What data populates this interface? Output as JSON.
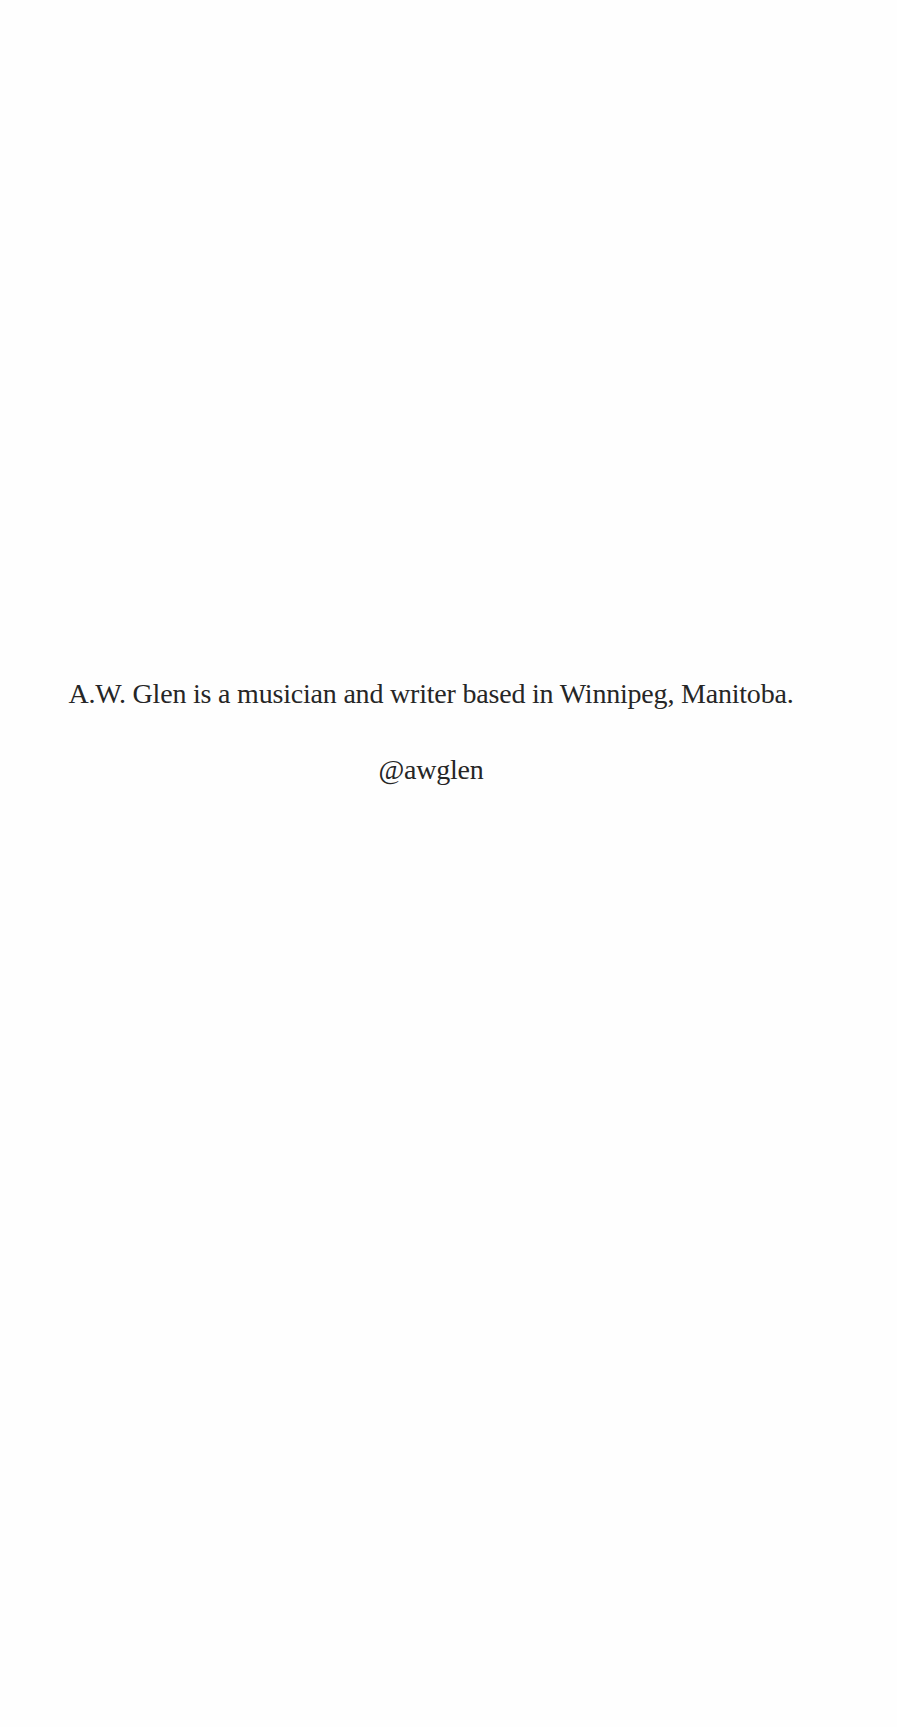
{
  "page": {
    "bio_text": "A.W. Glen is a musician and writer based in Winnipeg, Manitoba.",
    "social_handle": "@awglen",
    "colors": {
      "background": "#fefefe",
      "text": "#262626"
    }
  }
}
